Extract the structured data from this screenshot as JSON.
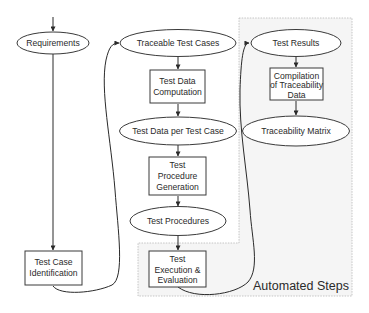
{
  "diagram": {
    "type": "flowchart",
    "colors": {
      "stroke": "#3a3a3a",
      "node_fill": "#ffffff",
      "region_fill": "#f5f5f5",
      "region_border": "#b8b8b8",
      "text": "#2a2a2a"
    },
    "region": {
      "label": "Automated Steps"
    },
    "nodes": {
      "requirements": {
        "shape": "ellipse",
        "lines": [
          "Requirements"
        ]
      },
      "test_case_identification": {
        "shape": "rect",
        "lines": [
          "Test Case",
          "Identification"
        ]
      },
      "traceable_test_cases": {
        "shape": "ellipse",
        "lines": [
          "Traceable Test Cases"
        ]
      },
      "test_data_computation": {
        "shape": "rect",
        "lines": [
          "Test Data",
          "Computation"
        ]
      },
      "test_data_per_test_case": {
        "shape": "ellipse",
        "lines": [
          "Test Data per Test Case"
        ]
      },
      "test_procedure_generation": {
        "shape": "rect",
        "lines": [
          "Test",
          "Procedure",
          "Generation"
        ]
      },
      "test_procedures": {
        "shape": "ellipse",
        "lines": [
          "Test Procedures"
        ]
      },
      "test_execution_evaluation": {
        "shape": "rect",
        "lines": [
          "Test",
          "Execution &",
          "Evaluation"
        ]
      },
      "test_results": {
        "shape": "ellipse",
        "lines": [
          "Test Results"
        ]
      },
      "compilation_traceability_data": {
        "shape": "rect",
        "lines": [
          "Compilation",
          "of Traceability",
          "Data"
        ]
      },
      "traceability_matrix": {
        "shape": "ellipse",
        "lines": [
          "Traceability Matrix"
        ]
      }
    },
    "edges": [
      {
        "from": "(entry)",
        "to": "Requirements"
      },
      {
        "from": "Requirements",
        "to": "Test Case Identification"
      },
      {
        "from": "Test Case Identification",
        "to": "Traceable Test Cases"
      },
      {
        "from": "Traceable Test Cases",
        "to": "Test Data Computation"
      },
      {
        "from": "Test Data Computation",
        "to": "Test Data per Test Case"
      },
      {
        "from": "Test Data per Test Case",
        "to": "Test Procedure Generation"
      },
      {
        "from": "Test Procedure Generation",
        "to": "Test Procedures"
      },
      {
        "from": "Test Procedures",
        "to": "Test Execution & Evaluation"
      },
      {
        "from": "Test Execution & Evaluation",
        "to": "Test Results"
      },
      {
        "from": "Test Results",
        "to": "Compilation of Traceability Data"
      },
      {
        "from": "Compilation of Traceability Data",
        "to": "Traceability Matrix"
      }
    ]
  }
}
